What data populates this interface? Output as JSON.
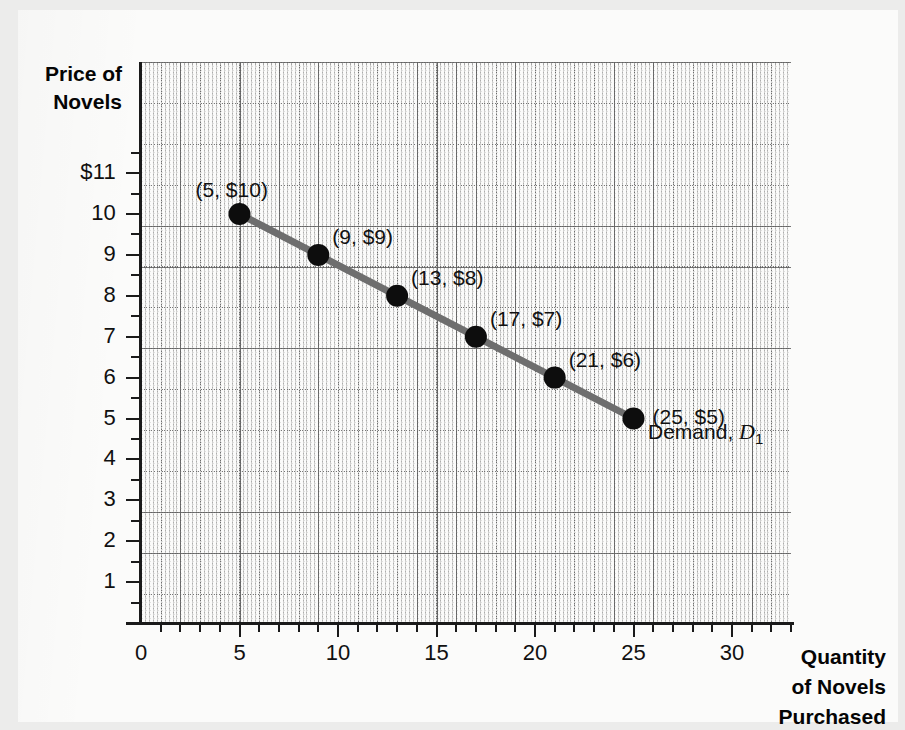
{
  "chart_data": {
    "type": "line",
    "title": "",
    "xlabel": "Quantity of Novels Purchased",
    "ylabel": "Price of Novels",
    "xlim": [
      0,
      33
    ],
    "ylim": [
      0,
      11.5
    ],
    "grid": true,
    "legend_position": "inline-right",
    "x": [
      5,
      9,
      13,
      17,
      21,
      25
    ],
    "values": [
      10,
      9,
      8,
      7,
      6,
      5
    ],
    "series": [
      {
        "name": "Demand, D1",
        "x": [
          5,
          9,
          13,
          17,
          21,
          25
        ],
        "values": [
          10,
          9,
          8,
          7,
          6,
          5
        ],
        "color": "#6e6e6e",
        "marker_color": "#0d0d0d"
      }
    ],
    "x_tick_labels": [
      "0",
      "5",
      "10",
      "15",
      "20",
      "25",
      "30"
    ],
    "x_tick_values": [
      0,
      5,
      10,
      15,
      20,
      25,
      30
    ],
    "y_tick_labels": [
      "1",
      "2",
      "3",
      "4",
      "5",
      "6",
      "7",
      "8",
      "9",
      "10",
      "$11"
    ],
    "y_tick_values": [
      1,
      2,
      3,
      4,
      5,
      6,
      7,
      8,
      9,
      10,
      11
    ],
    "point_labels": [
      "(5, $10)",
      "(9, $9)",
      "(13, $8)",
      "(17, $7)",
      "(21, $6)",
      "(25, $5)"
    ],
    "annotations": [
      {
        "text": "Demand, D1",
        "x": 25.8,
        "y": 4.85
      }
    ]
  },
  "axes": {
    "y_title_lines": [
      "Price of",
      "Novels"
    ],
    "x_title_lines": [
      "Quantity",
      "of Novels",
      "Purchased"
    ]
  },
  "curve_label": {
    "prefix": "Demand, ",
    "symbol": "D",
    "subscript": "1"
  },
  "colors": {
    "line": "#6e6e6e",
    "marker": "#0d0d0d",
    "axis": "#1a1a1a",
    "grid": "#787878",
    "paper": "#fbfbfa",
    "page": "#ececeb",
    "text": "#101010"
  }
}
